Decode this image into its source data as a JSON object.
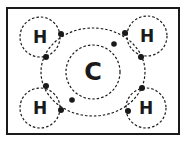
{
  "diagram": {
    "center_atom": {
      "symbol": "C"
    },
    "outer_atoms": [
      {
        "symbol": "H",
        "position": "top-left"
      },
      {
        "symbol": "H",
        "position": "top-right"
      },
      {
        "symbol": "H",
        "position": "bottom-left"
      },
      {
        "symbol": "H",
        "position": "bottom-right"
      }
    ],
    "shared_electron_pairs": 4,
    "inner_shell_electrons": 2,
    "colors": {
      "line": "#1a1a1a",
      "background": "#ffffff"
    }
  }
}
